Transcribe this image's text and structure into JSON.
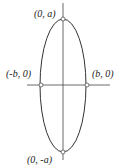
{
  "diagram": {
    "type": "ellipse-vertical",
    "labels": {
      "top": "(0, a)",
      "bottom": "(0, -a)",
      "left": "(-b, 0)",
      "right": "(b, 0)"
    },
    "colors": {
      "stroke": "#333333",
      "point_fill": "#ffffff"
    }
  }
}
